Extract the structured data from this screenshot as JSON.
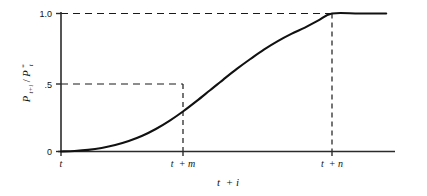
{
  "chart_data": {
    "type": "line",
    "title": "",
    "xlabel": "t + i",
    "ylabel": "P(t+i)/P*(t)",
    "ylim": [
      0,
      1.0
    ],
    "grid": false,
    "legend": null,
    "y_ticks": [
      {
        "value": 1.0,
        "label": "1.0"
      },
      {
        "value": 0.5,
        "label": ".5"
      },
      {
        "value": 0.0,
        "label": "0"
      }
    ],
    "x_ticks": [
      {
        "label_main": "t",
        "label_extra": "",
        "position": "t"
      },
      {
        "label_main": "t",
        "label_extra": "+ m",
        "position": "t+m"
      },
      {
        "label_main": "t",
        "label_extra": "+ n",
        "position": "t+n"
      }
    ],
    "curve_description": "sigmoid / logistic adjustment path rising from 0 at t to 1.0 at t+n then flat",
    "x": [
      0,
      0.05,
      0.1,
      0.15,
      0.2,
      0.25,
      0.3,
      0.35,
      0.4,
      0.45,
      0.5,
      0.55,
      0.6,
      0.65,
      0.7,
      0.75,
      0.8,
      0.85,
      0.9,
      0.95,
      1.0,
      1.1,
      1.2,
      1.3
    ],
    "y": [
      0.0,
      0.004,
      0.012,
      0.026,
      0.047,
      0.076,
      0.114,
      0.163,
      0.222,
      0.29,
      0.365,
      0.444,
      0.523,
      0.6,
      0.672,
      0.74,
      0.8,
      0.852,
      0.898,
      0.95,
      1.0,
      1.0,
      1.0,
      1.0
    ],
    "guide_lines": [
      {
        "type": "horizontal",
        "at": 1.0,
        "to": "t+n",
        "style": "dashed"
      },
      {
        "type": "horizontal",
        "at": 0.5,
        "to": "t+m",
        "style": "dashed"
      },
      {
        "type": "vertical",
        "at": "t+m",
        "to": 0.5,
        "style": "dashed"
      },
      {
        "type": "vertical",
        "at": "t+n",
        "to": 1.0,
        "style": "dashed"
      }
    ],
    "colors": {
      "line": "#111111",
      "axis": "#333333",
      "guide": "#222222",
      "background": "#ffffff"
    }
  },
  "ylabel_parts": {
    "p1": "P",
    "sub1": "t+i",
    "slash": "/",
    "p2": "P",
    "sub2": "t",
    "star": "*"
  },
  "xlabel_parts": {
    "t": "t",
    "plus_i": "+ i"
  }
}
